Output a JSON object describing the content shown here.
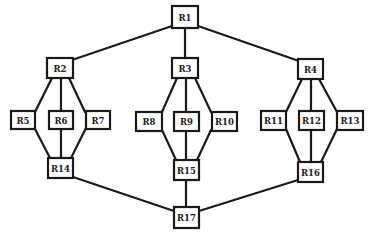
{
  "diagram": {
    "type": "network-topology",
    "colors": {
      "line": "#1a1a1a",
      "box_fill": "#ffffff",
      "text": "#222222",
      "background": "#ffffff"
    },
    "nodes": [
      {
        "id": "R1",
        "label": "R1",
        "x": 172,
        "y": 6,
        "w": 26,
        "h": 22
      },
      {
        "id": "R2",
        "label": "R2",
        "x": 47,
        "y": 58,
        "w": 26,
        "h": 20
      },
      {
        "id": "R3",
        "label": "R3",
        "x": 172,
        "y": 58,
        "w": 26,
        "h": 20
      },
      {
        "id": "R4",
        "label": "R4",
        "x": 298,
        "y": 59,
        "w": 25,
        "h": 20
      },
      {
        "id": "R5",
        "label": "R5",
        "x": 11,
        "y": 111,
        "w": 24,
        "h": 18
      },
      {
        "id": "R6",
        "label": "R6",
        "x": 49,
        "y": 111,
        "w": 24,
        "h": 18
      },
      {
        "id": "R7",
        "label": "R7",
        "x": 86,
        "y": 111,
        "w": 24,
        "h": 18
      },
      {
        "id": "R8",
        "label": "R8",
        "x": 136,
        "y": 112,
        "w": 26,
        "h": 19
      },
      {
        "id": "R9",
        "label": "R9",
        "x": 174,
        "y": 112,
        "w": 25,
        "h": 19
      },
      {
        "id": "R10",
        "label": "R10",
        "x": 212,
        "y": 112,
        "w": 25,
        "h": 19
      },
      {
        "id": "R11",
        "label": "R11",
        "x": 261,
        "y": 111,
        "w": 25,
        "h": 19
      },
      {
        "id": "R12",
        "label": "R12",
        "x": 299,
        "y": 111,
        "w": 25,
        "h": 19
      },
      {
        "id": "R13",
        "label": "R13",
        "x": 337,
        "y": 111,
        "w": 26,
        "h": 19
      },
      {
        "id": "R14",
        "label": "R14",
        "x": 48,
        "y": 158,
        "w": 25,
        "h": 20
      },
      {
        "id": "R15",
        "label": "R15",
        "x": 174,
        "y": 160,
        "w": 25,
        "h": 20
      },
      {
        "id": "R16",
        "label": "R16",
        "x": 298,
        "y": 162,
        "w": 25,
        "h": 20
      },
      {
        "id": "R17",
        "label": "R17",
        "x": 174,
        "y": 207,
        "w": 25,
        "h": 21
      }
    ],
    "edges": [
      {
        "from": "R1",
        "to": "R2",
        "x1": 172,
        "y1": 26,
        "x2": 72,
        "y2": 60
      },
      {
        "from": "R1",
        "to": "R3",
        "x1": 185,
        "y1": 28,
        "x2": 185,
        "y2": 58
      },
      {
        "from": "R1",
        "to": "R4",
        "x1": 198,
        "y1": 26,
        "x2": 299,
        "y2": 61
      },
      {
        "from": "R2",
        "to": "R5",
        "x1": 52,
        "y1": 78,
        "x2": 35,
        "y2": 112
      },
      {
        "from": "R2",
        "to": "R6",
        "x1": 61,
        "y1": 78,
        "x2": 61,
        "y2": 111
      },
      {
        "from": "R2",
        "to": "R7",
        "x1": 69,
        "y1": 78,
        "x2": 85,
        "y2": 112
      },
      {
        "from": "R5",
        "to": "R14",
        "x1": 35,
        "y1": 129,
        "x2": 50,
        "y2": 158
      },
      {
        "from": "R6",
        "to": "R14",
        "x1": 61,
        "y1": 129,
        "x2": 61,
        "y2": 158
      },
      {
        "from": "R7",
        "to": "R14",
        "x1": 86,
        "y1": 128,
        "x2": 71,
        "y2": 158
      },
      {
        "from": "R3",
        "to": "R8",
        "x1": 177,
        "y1": 78,
        "x2": 162,
        "y2": 112
      },
      {
        "from": "R3",
        "to": "R9",
        "x1": 186,
        "y1": 78,
        "x2": 186,
        "y2": 112
      },
      {
        "from": "R3",
        "to": "R10",
        "x1": 195,
        "y1": 78,
        "x2": 211,
        "y2": 112
      },
      {
        "from": "R8",
        "to": "R15",
        "x1": 162,
        "y1": 130,
        "x2": 176,
        "y2": 160
      },
      {
        "from": "R9",
        "to": "R15",
        "x1": 186,
        "y1": 131,
        "x2": 186,
        "y2": 160
      },
      {
        "from": "R10",
        "to": "R15",
        "x1": 211,
        "y1": 130,
        "x2": 197,
        "y2": 160
      },
      {
        "from": "R4",
        "to": "R11",
        "x1": 302,
        "y1": 79,
        "x2": 286,
        "y2": 112
      },
      {
        "from": "R4",
        "to": "R12",
        "x1": 311,
        "y1": 79,
        "x2": 311,
        "y2": 111
      },
      {
        "from": "R4",
        "to": "R13",
        "x1": 319,
        "y1": 79,
        "x2": 337,
        "y2": 112
      },
      {
        "from": "R11",
        "to": "R16",
        "x1": 286,
        "y1": 129,
        "x2": 300,
        "y2": 162
      },
      {
        "from": "R12",
        "to": "R16",
        "x1": 311,
        "y1": 130,
        "x2": 311,
        "y2": 162
      },
      {
        "from": "R13",
        "to": "R16",
        "x1": 337,
        "y1": 129,
        "x2": 321,
        "y2": 162
      },
      {
        "from": "R14",
        "to": "R17",
        "x1": 73,
        "y1": 177,
        "x2": 174,
        "y2": 211
      },
      {
        "from": "R15",
        "to": "R17",
        "x1": 186,
        "y1": 180,
        "x2": 186,
        "y2": 207
      },
      {
        "from": "R16",
        "to": "R17",
        "x1": 298,
        "y1": 180,
        "x2": 199,
        "y2": 211
      }
    ]
  }
}
